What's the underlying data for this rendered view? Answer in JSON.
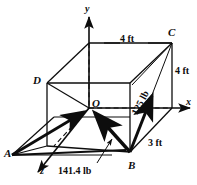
{
  "figure": {
    "background_color": "#ffffff",
    "line_color": "#0d0d0d",
    "axes": [
      {
        "name": "y-axis",
        "label": "y"
      },
      {
        "name": "x-axis",
        "label": "x"
      },
      {
        "name": "z-axis",
        "label": "z"
      }
    ],
    "points": [
      {
        "name": "point-a",
        "label": "A"
      },
      {
        "name": "point-b",
        "label": "B"
      },
      {
        "name": "point-c",
        "label": "C"
      },
      {
        "name": "point-d",
        "label": "D"
      },
      {
        "name": "point-o",
        "label": "O"
      }
    ],
    "dimensions": [
      {
        "name": "top-edge",
        "label": "4 ft"
      },
      {
        "name": "right-vertical-edge",
        "label": "4 ft"
      },
      {
        "name": "depth-edge",
        "label": "3 ft"
      }
    ],
    "forces": [
      {
        "name": "force-bc",
        "label": "125 lb"
      },
      {
        "name": "force-bo",
        "label": "141.4 lb"
      }
    ]
  }
}
